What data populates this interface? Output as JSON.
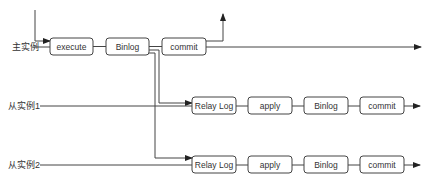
{
  "rows": {
    "master": {
      "label": "主实例",
      "boxes": [
        "execute",
        "Binlog",
        "commit"
      ]
    },
    "slave1": {
      "label": "从实例1",
      "boxes": [
        "Relay Log",
        "apply",
        "Binlog",
        "commit"
      ]
    },
    "slave2": {
      "label": "从实例2",
      "boxes": [
        "Relay Log",
        "apply",
        "Binlog",
        "commit"
      ]
    }
  },
  "colors": {
    "stroke": "#444444",
    "text": "#333333",
    "background": "#ffffff"
  }
}
